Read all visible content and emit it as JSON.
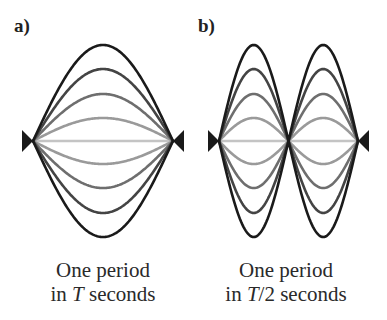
{
  "panels": [
    {
      "id": "a",
      "label": "a)",
      "caption": {
        "line1": "One period",
        "line2_prefix": "in ",
        "line2_var": "T",
        "line2_suffix": " seconds"
      },
      "x_start": 33,
      "x_end": 173,
      "baseline_y": 141,
      "loops": 1
    },
    {
      "id": "b",
      "label": "b)",
      "caption": {
        "line1": "One period",
        "line2_prefix": "in ",
        "line2_var": "T",
        "line2_suffix": "/2 seconds"
      },
      "x_start": 219,
      "x_end": 358,
      "baseline_y": 141,
      "loops": 2
    }
  ],
  "amplitudes": [
    96,
    72,
    47,
    23,
    0
  ],
  "stroke_colors": [
    "#1a1a1a",
    "#444444",
    "#6e6e6e",
    "#9a9a9a",
    "#c4c4c4"
  ],
  "anchor_color": "#1a1a1a"
}
